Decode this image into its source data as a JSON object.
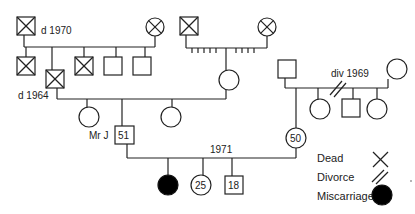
{
  "diagram": {
    "type": "pedigree",
    "annotations": {
      "grandfather_death": "d  1970",
      "father_death": "d  1964",
      "divorce": "div  1969",
      "proband_label": "Mr  J",
      "marriage_year": "1971"
    },
    "ages": {
      "proband": "51",
      "wife": "50",
      "daughter": "25",
      "son": "18"
    },
    "legend": {
      "dead": "Dead",
      "divorce": "Divorce",
      "miscarriage": "Miscarriage"
    },
    "colors": {
      "line": "#222222",
      "fill_affected": "#000000",
      "background": "#ffffff"
    }
  }
}
